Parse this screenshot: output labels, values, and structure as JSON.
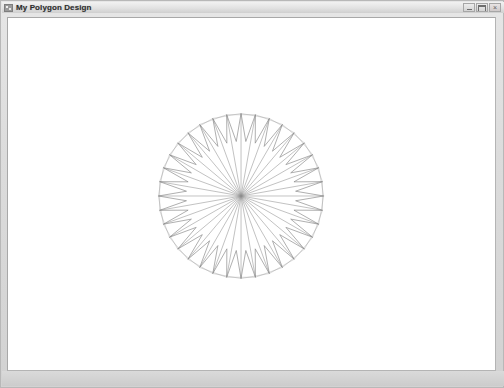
{
  "window": {
    "title": "My Polygon Design",
    "icon": "application-icon",
    "frame_color": "#d9d9d9",
    "titlebar_color": "#e2e2e2",
    "controls": [
      {
        "name": "minimize",
        "label": "Minimize",
        "glyph": "_"
      },
      {
        "name": "maximize",
        "label": "Maximize",
        "glyph": "□"
      },
      {
        "name": "close",
        "label": "Close",
        "glyph": "×"
      }
    ]
  },
  "canvas": {
    "name": "polygon-design-canvas",
    "background": "#ffffff",
    "width": 489,
    "height": 354
  },
  "chart_data": {
    "type": "line",
    "title": "My Polygon Design",
    "xlabel": "",
    "ylabel": "",
    "figure": "star-polygon-spirograph",
    "center": {
      "x": 234,
      "y": 179
    },
    "points": 36,
    "outer_radius": 83,
    "inner_radius": 55,
    "spoke_radius": 83,
    "rotation_offset_deg": -90,
    "chord_skip": 2,
    "line_color": "#8c8c8c",
    "line_width": 0.7,
    "spoke_color": "#909090",
    "spoke_width": 0.55,
    "draw_spokes": true,
    "draw_zigzag": true,
    "grid": false,
    "legend": null,
    "xlim": [
      0,
      489
    ],
    "ylim": [
      0,
      354
    ]
  }
}
